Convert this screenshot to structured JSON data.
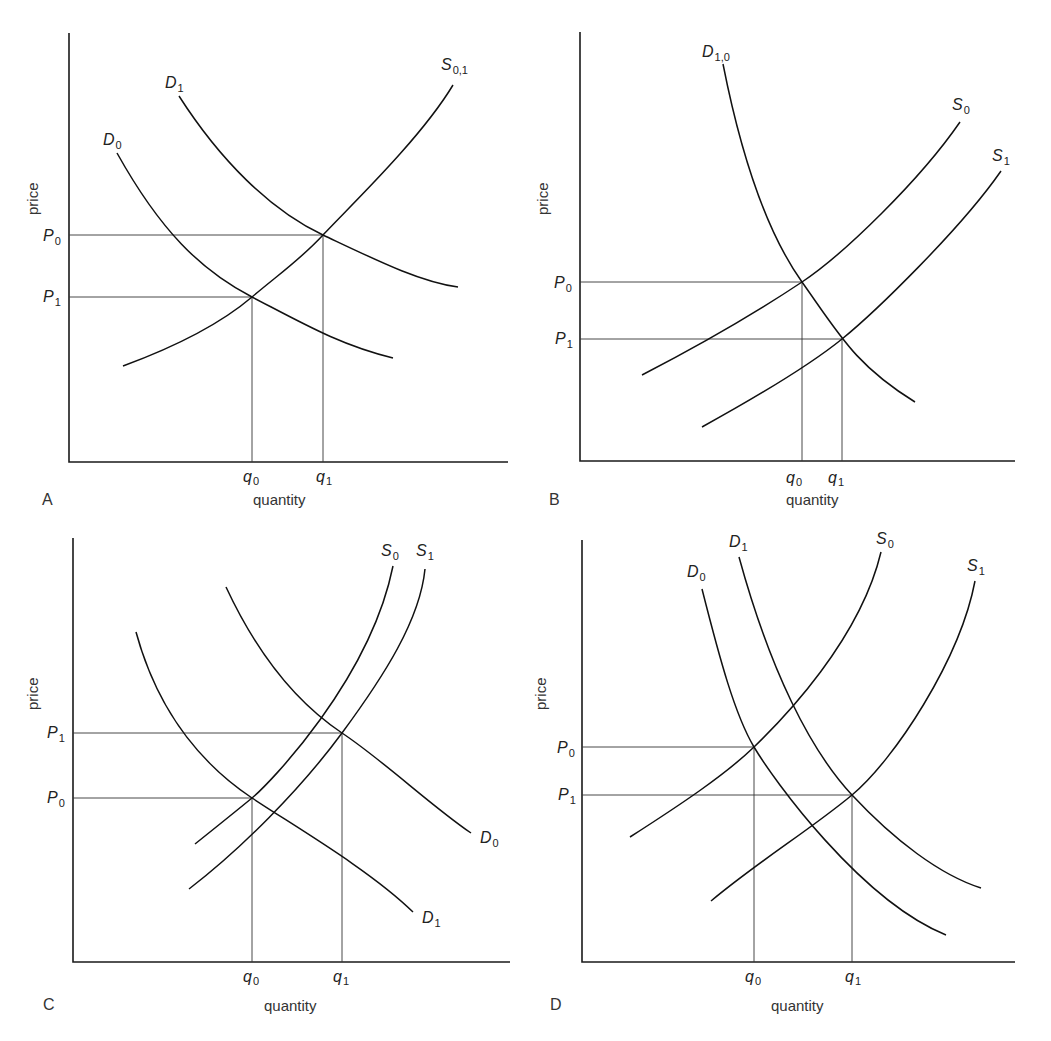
{
  "panels": [
    {
      "id": "A",
      "letter": "A",
      "xlabel": "quantity",
      "ylabel": "price",
      "price_labels": [
        {
          "sym": "P",
          "sub": "0"
        },
        {
          "sym": "P",
          "sub": "1"
        }
      ],
      "qty_labels": [
        {
          "sym": "q",
          "sub": "0"
        },
        {
          "sym": "q",
          "sub": "1"
        }
      ],
      "curves": [
        {
          "name": "D",
          "sub": "0",
          "type": "demand"
        },
        {
          "name": "D",
          "sub": "1",
          "type": "demand"
        },
        {
          "name": "S",
          "sub": "0,1",
          "type": "supply"
        }
      ]
    },
    {
      "id": "B",
      "letter": "B",
      "xlabel": "quantity",
      "ylabel": "price",
      "price_labels": [
        {
          "sym": "P",
          "sub": "0"
        },
        {
          "sym": "P",
          "sub": "1"
        }
      ],
      "qty_labels": [
        {
          "sym": "q",
          "sub": "0"
        },
        {
          "sym": "q",
          "sub": "1"
        }
      ],
      "curves": [
        {
          "name": "D",
          "sub": "1,0",
          "type": "demand"
        },
        {
          "name": "S",
          "sub": "0",
          "type": "supply"
        },
        {
          "name": "S",
          "sub": "1",
          "type": "supply"
        }
      ]
    },
    {
      "id": "C",
      "letter": "C",
      "xlabel": "quantity",
      "ylabel": "price",
      "price_labels": [
        {
          "sym": "P",
          "sub": "1"
        },
        {
          "sym": "P",
          "sub": "0"
        }
      ],
      "qty_labels": [
        {
          "sym": "q",
          "sub": "0"
        },
        {
          "sym": "q",
          "sub": "1"
        }
      ],
      "curves": [
        {
          "name": "S",
          "sub": "0",
          "type": "supply"
        },
        {
          "name": "S",
          "sub": "1",
          "type": "supply"
        },
        {
          "name": "D",
          "sub": "0",
          "type": "demand"
        },
        {
          "name": "D",
          "sub": "1",
          "type": "demand"
        }
      ]
    },
    {
      "id": "D",
      "letter": "D",
      "xlabel": "quantity",
      "ylabel": "price",
      "price_labels": [
        {
          "sym": "P",
          "sub": "0"
        },
        {
          "sym": "P",
          "sub": "1"
        }
      ],
      "qty_labels": [
        {
          "sym": "q",
          "sub": "0"
        },
        {
          "sym": "q",
          "sub": "1"
        }
      ],
      "curves": [
        {
          "name": "D",
          "sub": "0",
          "type": "demand"
        },
        {
          "name": "D",
          "sub": "1",
          "type": "demand"
        },
        {
          "name": "S",
          "sub": "0",
          "type": "supply"
        },
        {
          "name": "S",
          "sub": "1",
          "type": "supply"
        }
      ]
    }
  ]
}
